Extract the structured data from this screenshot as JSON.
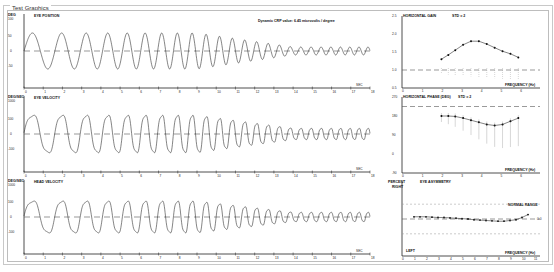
{
  "window": {
    "title": "Test Graphics"
  },
  "annotation": "Dynamic CRP value: 6.45 microvolts / degree",
  "panels": {
    "eye_position": {
      "unit": "DEG",
      "title": "EYE POSITION",
      "ymax": "100",
      "yticks": [
        "50",
        "10",
        "0",
        "-50",
        "-100"
      ]
    },
    "eye_velocity": {
      "unit": "DEG/SEC",
      "title": "EYE VELOCITY",
      "ymax": "1000",
      "yticks": [
        "100",
        "0",
        "-100",
        "-1000"
      ]
    },
    "head_velocity": {
      "unit": "DEG/SEC",
      "title": "HEAD VELOCITY",
      "ymax": "1000",
      "yticks": [
        "100",
        "0",
        "-100",
        "-1000"
      ]
    },
    "sec_label": "SEC",
    "xticks": [
      "0",
      "1",
      "2",
      "3",
      "4",
      "5",
      "6",
      "7",
      "8",
      "9",
      "10",
      "11",
      "12",
      "13",
      "14",
      "15",
      "16",
      "17",
      "18"
    ]
  },
  "right_panels": {
    "gain": {
      "title": "HORIZONTAL GAIN",
      "std": "STD = 2",
      "yticks": [
        "2.5",
        "2.0",
        "1.5",
        "1.0",
        "0.5"
      ],
      "xlabel": "FREQUENCY (Hz)"
    },
    "phase": {
      "title": "HORIZONTAL PHASE (DEG)",
      "std": "STD = 2",
      "yticks": [
        "270",
        "180",
        "90",
        "0",
        "-90"
      ],
      "xlabel": "FREQUENCY (Hz)"
    },
    "asymmetry": {
      "unit": "PERCENT",
      "title": "EYE ASYMMETRY",
      "right": "RIGHT",
      "left": "LEFT",
      "normal": "NORMAL RANGE",
      "yticks": [
        "50",
        "30",
        "10",
        "0",
        "-10",
        "-30",
        "-50"
      ],
      "value": "0.0",
      "xlabel": "FREQUENCY (Hz)"
    },
    "freq_ticks": [
      "0",
      "1",
      "2",
      "3",
      "4",
      "5",
      "6"
    ],
    "asym_ticks": [
      "0",
      "1",
      "2",
      "3",
      "4",
      "5",
      "6",
      "7",
      "8",
      "9",
      "10",
      "11"
    ]
  },
  "chart_data": [
    {
      "type": "line",
      "title": "EYE POSITION",
      "xlabel": "SEC",
      "ylabel": "DEG",
      "xlim": [
        0,
        18
      ],
      "ylim": [
        -100,
        100
      ],
      "description": "Sinusoidal eye position; amplitude ~40 deg declining to ~5 deg as frequency increases with time"
    },
    {
      "type": "line",
      "title": "EYE VELOCITY",
      "xlabel": "SEC",
      "ylabel": "DEG/SEC",
      "xlim": [
        0,
        18
      ],
      "ylim": [
        -1000,
        1000
      ],
      "description": "Eye velocity oscillation ~300 deg/s amplitude, frequency increasing (chirp), amplitude decays after ~12 s"
    },
    {
      "type": "line",
      "title": "HEAD VELOCITY",
      "xlabel": "SEC",
      "ylabel": "DEG/SEC",
      "xlim": [
        0,
        18
      ],
      "ylim": [
        -1000,
        1000
      ],
      "description": "Head velocity oscillation similar chirp profile"
    },
    {
      "type": "line",
      "title": "HORIZONTAL GAIN",
      "xlabel": "FREQUENCY (Hz)",
      "xlim": [
        0,
        7
      ],
      "ylim": [
        0.5,
        2.5
      ],
      "x": [
        2.0,
        2.35,
        2.7,
        3.1,
        3.5,
        3.9,
        4.3,
        4.7,
        5.1,
        5.5,
        5.9
      ],
      "y": [
        1.3,
        1.42,
        1.55,
        1.7,
        1.8,
        1.8,
        1.72,
        1.62,
        1.52,
        1.45,
        1.35
      ],
      "reference": 1.0
    },
    {
      "type": "line",
      "title": "HORIZONTAL PHASE (DEG)",
      "xlabel": "FREQUENCY (Hz)",
      "xlim": [
        0,
        7
      ],
      "ylim": [
        -90,
        270
      ],
      "x": [
        2.0,
        2.35,
        2.7,
        3.1,
        3.5,
        3.9,
        4.3,
        4.7,
        5.1,
        5.5,
        5.9
      ],
      "y": [
        180,
        180,
        178,
        170,
        160,
        150,
        140,
        135,
        140,
        155,
        170
      ],
      "reference": 225
    },
    {
      "type": "line",
      "title": "EYE ASYMMETRY",
      "xlabel": "FREQUENCY (Hz)",
      "ylabel": "PERCENT",
      "xlim": [
        0,
        11
      ],
      "ylim": [
        -50,
        50
      ],
      "x": [
        1,
        1.5,
        2,
        2.5,
        3,
        3.5,
        4,
        4.5,
        5,
        5.5,
        6,
        6.5,
        7,
        7.5,
        8,
        8.5,
        9,
        9.5,
        10,
        10.5
      ],
      "y": [
        3,
        3,
        3,
        2.5,
        2,
        2,
        1.5,
        1,
        0.5,
        0,
        -1,
        -1.5,
        -2,
        -2.5,
        -3,
        -3,
        -2,
        -1,
        2,
        6
      ],
      "normal_range": [
        -20,
        20
      ]
    }
  ]
}
